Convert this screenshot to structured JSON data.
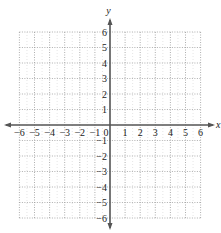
{
  "chart_data": {
    "type": "scatter",
    "title": "",
    "xlabel": "x",
    "ylabel": "y",
    "xlim": [
      -6,
      6
    ],
    "ylim": [
      -6,
      6
    ],
    "grid": true,
    "grid_style": "dotted",
    "x_ticks": [
      -6,
      -5,
      -4,
      -3,
      -2,
      -1,
      0,
      1,
      2,
      3,
      4,
      5,
      6
    ],
    "y_ticks": [
      -6,
      -5,
      -4,
      -3,
      -2,
      -1,
      1,
      2,
      3,
      4,
      5,
      6
    ],
    "x_tick_labels": [
      "−6",
      "−5",
      "−4",
      "−3",
      "−2",
      "−1",
      "0",
      "1",
      "2",
      "3",
      "4",
      "5",
      "6"
    ],
    "y_tick_labels": [
      "−6",
      "−5",
      "−4",
      "−3",
      "−2",
      "−1",
      "1",
      "2",
      "3",
      "4",
      "5",
      "6"
    ],
    "series": [],
    "legend": null
  },
  "colors": {
    "axis": "#555555",
    "grid": "#9a9a9a",
    "text": "#222222"
  }
}
